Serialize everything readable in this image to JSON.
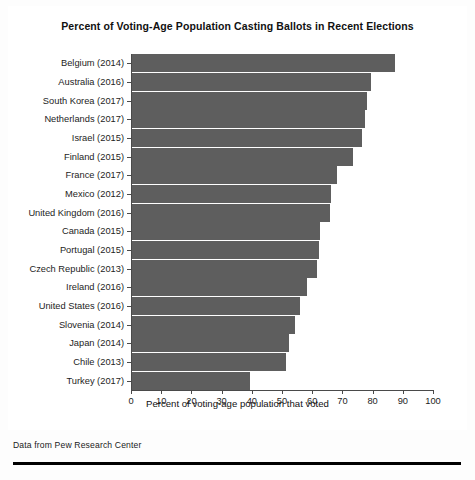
{
  "chart_data": {
    "type": "bar",
    "orientation": "horizontal",
    "title": "Percent of Voting-Age Population Casting Ballots in Recent Elections",
    "xlabel": "Percent of voting-age population that voted",
    "ylabel": "",
    "xlim": [
      0,
      100
    ],
    "xticks": [
      0,
      10,
      20,
      30,
      40,
      50,
      60,
      70,
      80,
      90,
      100
    ],
    "grid": false,
    "legend": null,
    "bar_color": "#5e5e5e",
    "categories": [
      "Belgium (2014)",
      "Australia (2016)",
      "South Korea (2017)",
      "Netherlands (2017)",
      "Israel (2015)",
      "Finland (2015)",
      "France (2017)",
      "Mexico (2012)",
      "United Kingdom (2016)",
      "Canada (2015)",
      "Portugal (2015)",
      "Czech Republic (2013)",
      "Ireland (2016)",
      "United States (2016)",
      "Slovenia (2014)",
      "Japan (2014)",
      "Chile (2013)",
      "Turkey (2017)"
    ],
    "values": [
      87.2,
      79.0,
      77.9,
      77.3,
      76.1,
      73.1,
      67.9,
      66.0,
      65.4,
      62.1,
      61.8,
      61.2,
      58.0,
      55.7,
      54.1,
      52.0,
      51.0,
      39.1
    ]
  },
  "footer": {
    "caption": "Data from Pew Research Center"
  }
}
